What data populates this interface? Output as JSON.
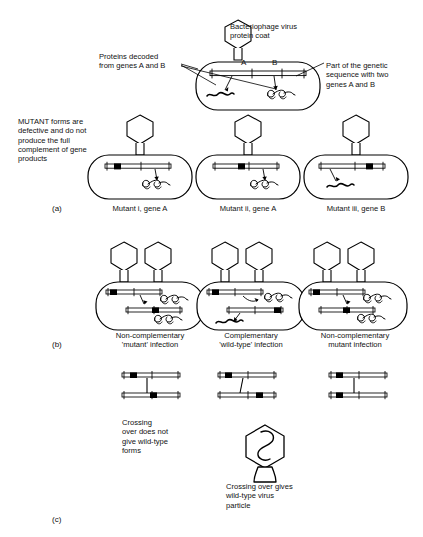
{
  "figure": {
    "background": "#ffffff",
    "ink": "#000000"
  },
  "annotations": {
    "phage_coat": "Bacteriophage virus\nprotein coat",
    "proteins_decoded": "Proteins decoded\nfrom genes A and B",
    "genetic_sequence": "Part of the genetic\nsequence with two\ngenes A and B",
    "mutant_note": "MUTANT forms are\ndefective and do not\nproduce the full\ncomplement of gene\nproducts",
    "gene_a": "A",
    "gene_b": "B"
  },
  "panels": {
    "a": {
      "tag": "(a)",
      "cells": [
        {
          "caption": "Mutant i, gene A",
          "mutation_gene": "A",
          "mutation_pos": 0.22,
          "protein": "coiled"
        },
        {
          "caption": "Mutant ii, gene A",
          "mutation_gene": "A",
          "mutation_pos": 0.52,
          "protein": "coiled"
        },
        {
          "caption": "Mutant iii, gene B",
          "mutation_gene": "B",
          "mutation_pos": 0.78,
          "protein": "wavy"
        }
      ]
    },
    "b": {
      "tag": "(b)",
      "cells": [
        {
          "caption": "Non-complementary\n'mutant' infection",
          "caption_line1": "Non-complementary",
          "caption_line2": "'mutant' infection",
          "strands": [
            {
              "mutation_pos": 0.12,
              "protein": "coiled"
            },
            {
              "mutation_pos": 0.52,
              "protein": "coiled"
            }
          ]
        },
        {
          "caption": "Complementary\n'wild-type' infection",
          "caption_line1": "Complementary",
          "caption_line2": "'wild-type' infection",
          "strands": [
            {
              "mutation_pos": 0.14,
              "protein": "coiled"
            },
            {
              "mutation_pos": 0.88,
              "protein": "wavy"
            }
          ]
        },
        {
          "caption": "Non-complementary\nmutant infection",
          "caption_line1": "Non-complementary",
          "caption_line2": "mutant infection",
          "strands": [
            {
              "mutation_pos": 0.12,
              "protein": "coiled"
            },
            {
              "mutation_pos": 0.44,
              "protein": "coiled"
            }
          ]
        }
      ]
    },
    "c": {
      "tag": "(c)",
      "crossovers": [
        {
          "top_mutation_pos": 0.2,
          "bottom_mutation_pos": 0.52,
          "crossing_x": 0.4
        },
        {
          "top_mutation_pos": 0.18,
          "bottom_mutation_pos": 0.7,
          "crossing_x": 0.38
        },
        {
          "top_mutation_pos": 0.18,
          "bottom_mutation_pos": 0.18,
          "crossing_x": 0.42
        }
      ],
      "caption_left": "Crossing\nover does not\ngive wild-type\nforms",
      "caption_left_lines": [
        "Crossing",
        "over does not",
        "give wild-type",
        "forms"
      ],
      "caption_bottom": "Crossing over gives\nwild-type virus\nparticle",
      "caption_bottom_lines": [
        "Crossing over gives",
        "wild-type virus",
        "particle"
      ]
    }
  }
}
